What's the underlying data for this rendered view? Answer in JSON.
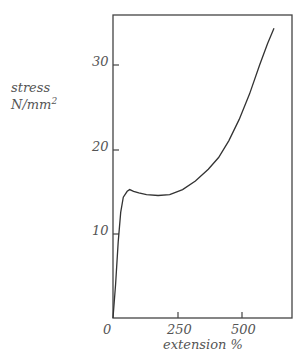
{
  "chart_data": {
    "type": "line",
    "title": "",
    "xlabel": "extension %",
    "ylabel": "stress",
    "ylabel_units": "N/mm²",
    "xlim": [
      0,
      690
    ],
    "ylim": [
      0,
      37
    ],
    "x_ticks": [
      "0",
      "250",
      "500"
    ],
    "y_ticks": [
      "10",
      "20",
      "30"
    ],
    "grid": false,
    "legend": null,
    "series": [
      {
        "name": "stress-strain curve",
        "x": [
          0,
          10,
          20,
          30,
          40,
          55,
          65,
          80,
          100,
          130,
          175,
          220,
          270,
          320,
          370,
          410,
          450,
          490,
          530,
          570,
          600,
          625
        ],
        "y": [
          0,
          4,
          9,
          12.5,
          14.3,
          15.0,
          15.2,
          15.0,
          14.8,
          14.6,
          14.5,
          14.6,
          15.2,
          16.2,
          17.6,
          19.0,
          21.0,
          23.5,
          26.5,
          30.0,
          32.5,
          34.3
        ]
      }
    ]
  },
  "labels": {
    "ylabel_line1": "stress",
    "ylabel_line2": "N/mm",
    "ylabel_sup": "2",
    "xlabel": "extension %",
    "x_tick_0": "0",
    "x_tick_250": "250",
    "x_tick_500": "500",
    "y_tick_10": "10",
    "y_tick_20": "20",
    "y_tick_30": "30"
  }
}
